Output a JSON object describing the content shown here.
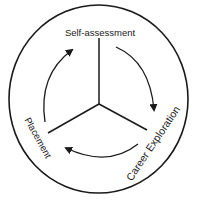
{
  "diagram": {
    "type": "cycle",
    "stages": [
      {
        "id": "self-assessment",
        "label": "Self-assessment"
      },
      {
        "id": "career-exploration",
        "label": "Career Exploration"
      },
      {
        "id": "placement",
        "label": "Placement"
      }
    ],
    "flow": [
      {
        "from": "Self-assessment",
        "to": "Career Exploration"
      },
      {
        "from": "Career Exploration",
        "to": "Placement"
      },
      {
        "from": "Placement",
        "to": "Self-assessment"
      }
    ],
    "direction": "clockwise",
    "colors": {
      "stroke": "#1a1a1a",
      "background": "#ffffff"
    }
  }
}
